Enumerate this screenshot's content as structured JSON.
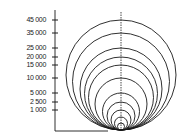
{
  "chart_data": {
    "type": "diagram-nested-circles",
    "title": "",
    "xlabel": "",
    "ylabel": "",
    "y_ticks": [
      "45 000",
      "35 000",
      "25 000",
      "20 000",
      "15 000",
      "10 000",
      "5 000",
      "2 500",
      "1 000"
    ],
    "y_tick_values": [
      45000,
      35000,
      25000,
      20000,
      15000,
      10000,
      5000,
      2500,
      1000
    ],
    "circles": [
      {
        "value": 45000,
        "top_px": 20
      },
      {
        "value": 35000,
        "top_px": 33
      },
      {
        "value": 25000,
        "top_px": 48
      },
      {
        "value": 20000,
        "top_px": 57
      },
      {
        "value": 15000,
        "top_px": 65
      },
      {
        "value": 10000,
        "top_px": 78
      },
      {
        "value": 5000,
        "top_px": 93
      },
      {
        "value": 2500,
        "top_px": 102
      },
      {
        "value": 1000,
        "top_px": 110
      },
      {
        "value": null,
        "top_px": 117
      },
      {
        "value": null,
        "top_px": 123
      }
    ],
    "tangent_point_px": {
      "x": 121,
      "y": 130
    },
    "grid": false,
    "legend": null
  },
  "colors": {
    "line": "#1a1a1a",
    "background": "#ffffff"
  }
}
